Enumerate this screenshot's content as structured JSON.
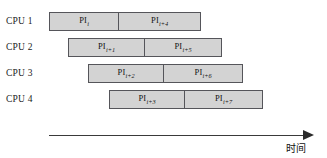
{
  "figure": {
    "type": "gantt-pipeline",
    "title": "",
    "background_color": "#ffffff",
    "bar_fill_color": "#d3d3d3",
    "bar_border_color": "#55555a",
    "text_color": "#141414"
  },
  "rows": [
    {
      "cpu_label": "CPU 1",
      "row_top": 12,
      "bar_left": 49,
      "bar_width": 152,
      "segments": [
        {
          "base": "PI",
          "subscript": "i",
          "width": 69
        },
        {
          "base": "PI",
          "subscript": "i+4",
          "width": 83
        }
      ]
    },
    {
      "cpu_label": "CPU 2",
      "row_top": 38,
      "bar_left": 68,
      "bar_width": 154,
      "segments": [
        {
          "base": "PI",
          "subscript": "i+1",
          "width": 76
        },
        {
          "base": "PI",
          "subscript": "i+5",
          "width": 78
        }
      ]
    },
    {
      "cpu_label": "CPU 3",
      "row_top": 64,
      "bar_left": 88,
      "bar_width": 155,
      "segments": [
        {
          "base": "PI",
          "subscript": "i+2",
          "width": 75
        },
        {
          "base": "PI",
          "subscript": "i+6",
          "width": 80
        }
      ]
    },
    {
      "cpu_label": "CPU 4",
      "row_top": 90,
      "bar_left": 109,
      "bar_width": 154,
      "segments": [
        {
          "base": "PI",
          "subscript": "i+3",
          "width": 75
        },
        {
          "base": "PI",
          "subscript": "i+7",
          "width": 79
        }
      ]
    }
  ],
  "axis": {
    "label": "时间",
    "direction": "right",
    "line_color": "#3a3a3a"
  }
}
